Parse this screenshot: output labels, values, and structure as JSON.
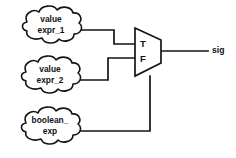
{
  "diagram": {
    "background_color": "#ffffff",
    "line_color": "#141414",
    "clouds": [
      {
        "id": "value-expr-1",
        "line1": "value",
        "line2": "expr_1",
        "shape": "cloud"
      },
      {
        "id": "value-expr-2",
        "line1": "value",
        "line2": "expr_2",
        "shape": "cloud"
      },
      {
        "id": "boolean-exp",
        "line1": "boolean_",
        "line2": "exp",
        "shape": "cloud"
      }
    ],
    "mux": {
      "id": "multiplexer",
      "shape": "trapezoid",
      "true_label": "T",
      "false_label": "F"
    },
    "output": {
      "id": "output-signal",
      "label": "sig"
    }
  }
}
